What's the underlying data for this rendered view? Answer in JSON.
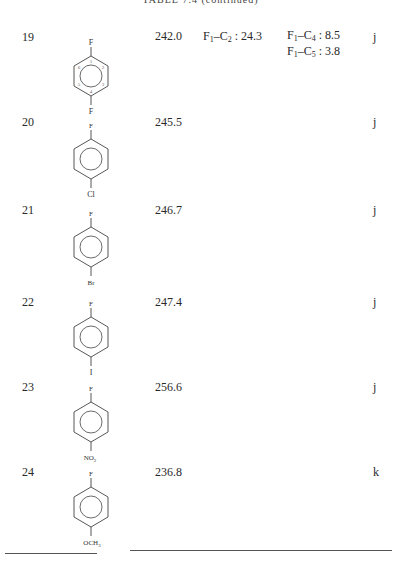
{
  "caption": "TABLE 7.4 (continued)",
  "rows": [
    {
      "id": "19",
      "structure": {
        "top": "F",
        "bottom": "F",
        "numbered": true,
        "labels": [
          "1",
          "2",
          "3",
          "4",
          "5",
          "6"
        ]
      },
      "shift": "242.0",
      "coupling_a": {
        "label": "F1–C2 : 24.3",
        "atom1": "F",
        "sub1": "1",
        "atom2": "C",
        "sub2": "2",
        "value": "24.3"
      },
      "coupling_b": [
        {
          "label": "F1–C4 : 8.5",
          "atom1": "F",
          "sub1": "1",
          "atom2": "C",
          "sub2": "4",
          "value": "8.5"
        },
        {
          "label": "F1–C5 : 3.8",
          "atom1": "F",
          "sub1": "1",
          "atom2": "C",
          "sub2": "5",
          "value": "3.8"
        }
      ],
      "ref": "j"
    },
    {
      "id": "20",
      "structure": {
        "top": "F",
        "bottom": "Cl"
      },
      "shift": "245.5",
      "ref": "j"
    },
    {
      "id": "21",
      "structure": {
        "top": "F",
        "bottom": "Br"
      },
      "shift": "246.7",
      "ref": "j"
    },
    {
      "id": "22",
      "structure": {
        "top": "F",
        "bottom": "I"
      },
      "shift": "247.4",
      "ref": "j"
    },
    {
      "id": "23",
      "structure": {
        "top": "F",
        "bottom": "NO2",
        "bottom_main": "NO",
        "bottom_sub": "2"
      },
      "shift": "256.6",
      "ref": "j"
    },
    {
      "id": "24",
      "structure": {
        "top": "F",
        "bottom": "OCH3",
        "bottom_main": "OCH",
        "bottom_sub": "3"
      },
      "shift": "236.8",
      "ref": "k"
    }
  ],
  "sep": ":"
}
